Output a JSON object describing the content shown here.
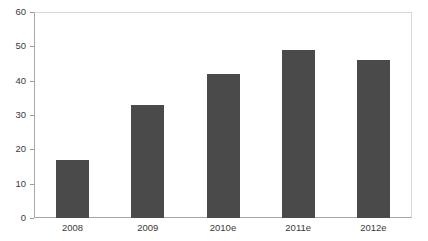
{
  "chart_data": {
    "type": "bar",
    "title": "",
    "subtitle": "",
    "xlabel": "",
    "ylabel": "",
    "categories": [
      "2008",
      "2009",
      "2010e",
      "2011e",
      "2012e"
    ],
    "values": [
      17,
      33,
      42,
      49,
      46
    ],
    "series": [
      {
        "name": "",
        "values": [
          17,
          33,
          42,
          49,
          46
        ]
      }
    ],
    "ylim": [
      0,
      60
    ],
    "yticks": [
      0,
      10,
      20,
      30,
      40,
      50,
      60
    ],
    "ytick_labels": [
      "0",
      "10",
      "20",
      "30",
      "40",
      "50",
      "60"
    ],
    "grid": false,
    "legend": false,
    "legend_position": "none",
    "annotations": [],
    "colors": {
      "bar": "#4a4a4a",
      "axis": "#a8a8a8",
      "frame": "#d8d8d8",
      "tick_label": "#3a3a3a",
      "background": "#ffffff"
    }
  }
}
